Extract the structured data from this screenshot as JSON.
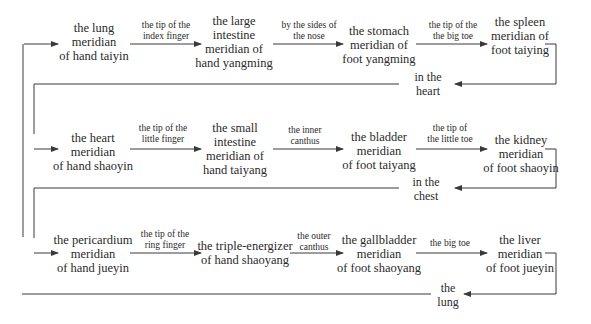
{
  "diagram": {
    "rows": [
      {
        "nodes": [
          {
            "lines": [
              "the lung",
              "meridian",
              "of hand taiyin"
            ]
          },
          {
            "lines": [
              "the large",
              "intestine",
              "meridian of",
              "hand yangming"
            ]
          },
          {
            "lines": [
              "the stomach",
              "meridian of",
              "foot yangming"
            ]
          },
          {
            "lines": [
              "the spleen",
              "meridian of",
              "foot taiying"
            ]
          }
        ],
        "edges": [
          {
            "lines": [
              "the tip of the",
              "index finger"
            ]
          },
          {
            "lines": [
              "by the sides of",
              "the nose"
            ]
          },
          {
            "lines": [
              "the tip of the",
              "the big toe"
            ]
          }
        ],
        "return_junction": {
          "lines": [
            "in the",
            "heart"
          ]
        }
      },
      {
        "nodes": [
          {
            "lines": [
              "the heart",
              "meridian",
              "of hand shaoyin"
            ]
          },
          {
            "lines": [
              "the small",
              "intestine",
              "meridian of",
              "hand taiyang"
            ]
          },
          {
            "lines": [
              "the bladder",
              "meridian",
              "of foot taiyang"
            ]
          },
          {
            "lines": [
              "the kidney",
              "meridian",
              "of foot shaoyin"
            ]
          }
        ],
        "edges": [
          {
            "lines": [
              "the tip of the",
              "little finger"
            ]
          },
          {
            "lines": [
              "the inner",
              "canthus"
            ]
          },
          {
            "lines": [
              "the tip of",
              "the little toe"
            ]
          }
        ],
        "return_junction": {
          "lines": [
            "in the",
            "chest"
          ]
        }
      },
      {
        "nodes": [
          {
            "lines": [
              "the pericardium",
              "meridian",
              "of hand jueyin"
            ]
          },
          {
            "lines": [
              "the triple-energizer",
              "of hand shaoyang"
            ]
          },
          {
            "lines": [
              "the gallbladder",
              "meridian",
              "of foot shaoyang"
            ]
          },
          {
            "lines": [
              "the liver",
              "meridian",
              "of foot jueyin"
            ]
          }
        ],
        "edges": [
          {
            "lines": [
              "the tip of the",
              "ring finger"
            ]
          },
          {
            "lines": [
              "the outer",
              "canthus"
            ]
          },
          {
            "lines": [
              "the big toe"
            ]
          }
        ],
        "return_junction": {
          "lines": [
            "the",
            "lung"
          ]
        }
      }
    ],
    "colors": {
      "line": "#3a3a3a",
      "text": "#2a2a2a",
      "background": "#ffffff"
    }
  }
}
